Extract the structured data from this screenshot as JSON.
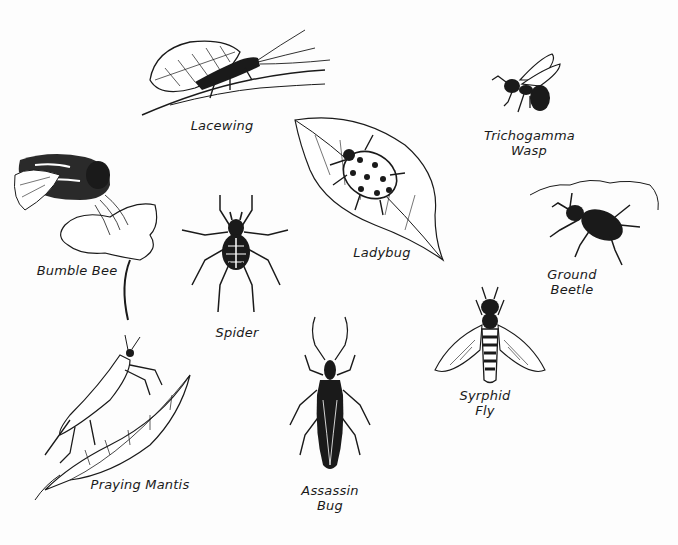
{
  "insects": [
    {
      "id": "lacewing",
      "label": "Lacewing"
    },
    {
      "id": "trichogramma-wasp",
      "label_line1": "Trichogamma",
      "label_line2": "Wasp"
    },
    {
      "id": "bumble-bee",
      "label": "Bumble Bee"
    },
    {
      "id": "ladybug",
      "label": "Ladybug"
    },
    {
      "id": "ground-beetle",
      "label_line1": "Ground",
      "label_line2": "Beetle"
    },
    {
      "id": "spider",
      "label": "Spider"
    },
    {
      "id": "syrphid-fly",
      "label_line1": "Syrphid",
      "label_line2": "Fly"
    },
    {
      "id": "praying-mantis",
      "label": "Praying Mantis"
    },
    {
      "id": "assassin-bug",
      "label_line1": "Assassin",
      "label_line2": "Bug"
    }
  ],
  "colors": {
    "ink": "#1a1a1a",
    "paper": "#fdfdfd"
  }
}
